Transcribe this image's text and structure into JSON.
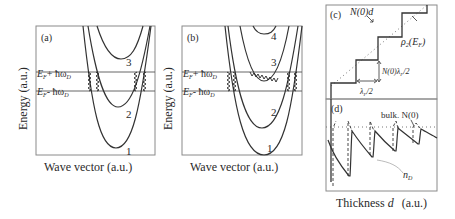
{
  "figure": {
    "panels": {
      "a": {
        "label": "(a)",
        "ylabel": "Energy (a.u.)",
        "xlabel": "Wave vector (a.u.)",
        "upper_line": "E_F + ħω_D",
        "lower_line": "E_F - ħω_D",
        "upper_main": "E",
        "upper_sub": "F",
        "upper_rest": "+ ħω",
        "upper_rest_sub": "D",
        "lower_main": "E",
        "lower_sub": "F",
        "lower_rest": "- ħω",
        "lower_rest_sub": "D",
        "bands": [
          "1",
          "2",
          "3"
        ]
      },
      "b": {
        "label": "(b)",
        "ylabel": "Energy (a.u.)",
        "xlabel": "Wave vector (a.u.)",
        "upper_main": "E",
        "upper_sub": "F",
        "upper_rest": "+ ħω",
        "upper_rest_sub": "D",
        "lower_main": "E",
        "lower_sub": "F",
        "lower_rest": "- ħω",
        "lower_rest_sub": "D",
        "bands": [
          "1",
          "2",
          "3",
          "4"
        ]
      },
      "c": {
        "label": "(c)",
        "bulk_line_label": "N(0)d",
        "stair_label_main": "ρ",
        "stair_label_sub": "2",
        "stair_label_rest": "(E",
        "stair_label_rest_sub": "F",
        "stair_label_close": ")",
        "step_height_label": "N(0)λ",
        "step_height_sub": "F",
        "step_height_rest": "/2",
        "step_width_label": "λ",
        "step_width_sub": "F",
        "step_width_rest": "/2"
      },
      "d": {
        "label": "(d)",
        "bulk_label": "bulk. N(0)",
        "curve_label_main": "n",
        "curve_label_sub": "D"
      },
      "cd_xlabel_main": "Thickness ",
      "cd_xlabel_var": "d",
      "cd_xlabel_units": "(a.u.)"
    }
  }
}
